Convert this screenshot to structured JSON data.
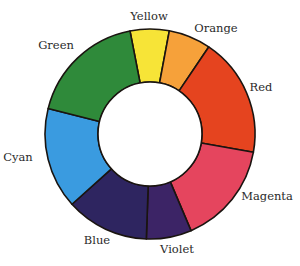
{
  "diagram": {
    "center": [
      150,
      134
    ],
    "outer_radius": 105,
    "inner_radius": 52,
    "stroke_color": "#1a1410",
    "hole_color": "#ffffff",
    "segments": [
      {
        "name": "Yellow",
        "label": "Yellow",
        "color": "#f7e437",
        "start": -11,
        "end": 10.6,
        "label_pos": [
          149,
          17
        ]
      },
      {
        "name": "Orange",
        "label": "Orange",
        "color": "#f6a13a",
        "start": 10.6,
        "end": 34,
        "label_pos": [
          216,
          29
        ]
      },
      {
        "name": "Red",
        "label": "Red",
        "color": "#e5441f",
        "start": 34,
        "end": 100,
        "label_pos": [
          261,
          88
        ]
      },
      {
        "name": "Magenta",
        "label": "Magenta",
        "color": "#e5455e",
        "start": 100,
        "end": 157,
        "label_pos": [
          267,
          197
        ]
      },
      {
        "name": "Violet",
        "label": "Violet",
        "color": "#3c2466",
        "start": 157,
        "end": 182,
        "label_pos": [
          177,
          250
        ]
      },
      {
        "name": "Blue",
        "label": "Blue",
        "color": "#2e2560",
        "start": 182,
        "end": 228,
        "label_pos": [
          97,
          241
        ]
      },
      {
        "name": "Cyan",
        "label": "Cyan",
        "color": "#3a9be0",
        "start": 228,
        "end": 284,
        "label_pos": [
          18,
          158
        ]
      },
      {
        "name": "Green",
        "label": "Green",
        "color": "#2f8a3a",
        "start": 284,
        "end": 349,
        "label_pos": [
          56,
          46
        ]
      }
    ]
  }
}
